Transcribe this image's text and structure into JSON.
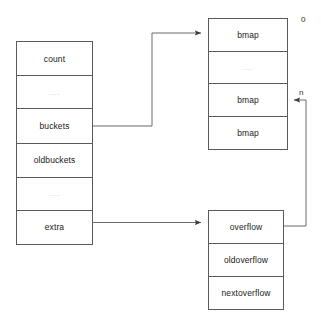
{
  "diagram": {
    "stroke_color": "#5a5a5a",
    "text_color": "#1a1a1a",
    "ellipsis_color": "#c8c8c8",
    "background": "#ffffff"
  },
  "hmap_struct": {
    "name": "hmap",
    "fields": [
      {
        "label": "count"
      },
      {
        "label": "...."
      },
      {
        "label": "buckets"
      },
      {
        "label": "oldbuckets"
      },
      {
        "label": "...."
      },
      {
        "label": "extra"
      }
    ]
  },
  "bmap_array": {
    "name": "buckets-array",
    "cells": [
      {
        "label": "bmap"
      },
      {
        "label": "...."
      },
      {
        "label": "bmap"
      },
      {
        "label": "bmap"
      }
    ],
    "index_first": "0",
    "index_last": "n"
  },
  "mapextra_struct": {
    "name": "mapextra",
    "fields": [
      {
        "label": "overflow"
      },
      {
        "label": "oldoverflow"
      },
      {
        "label": "nextoverflow"
      }
    ]
  },
  "connectors": [
    {
      "name": "buckets-to-bmap-array",
      "from": "buckets",
      "to": "bmap[0]"
    },
    {
      "name": "extra-to-mapextra",
      "from": "extra",
      "to": "overflow"
    },
    {
      "name": "overflow-to-bmap-n",
      "from": "overflow",
      "to": "bmap[n]"
    }
  ]
}
